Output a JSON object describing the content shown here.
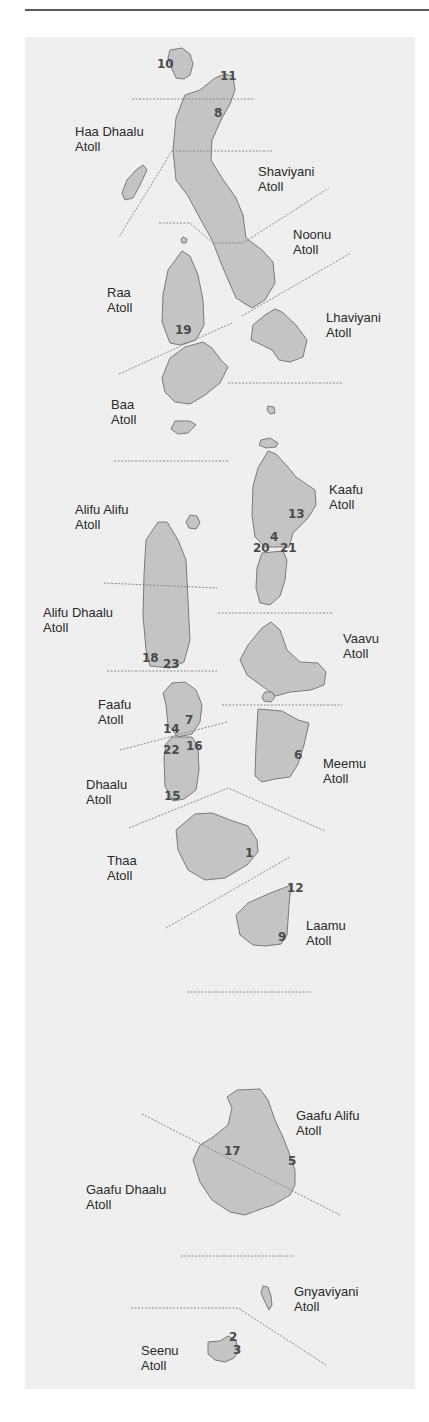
{
  "map": {
    "colors": {
      "panel": "#efefef",
      "island_fill": "#c4c4c4",
      "island_stroke": "#7a7a7a",
      "divider": "#8a8a8a",
      "label": "#2a2a2a",
      "number": "#4a4a4a"
    },
    "atolls": [
      {
        "name": "Haa Dhaalu",
        "suffix": "Atoll"
      },
      {
        "name": "Shaviyani",
        "suffix": "Atoll"
      },
      {
        "name": "Noonu",
        "suffix": "Atoll"
      },
      {
        "name": "Raa",
        "suffix": "Atoll"
      },
      {
        "name": "Lhaviyani",
        "suffix": "Atoll"
      },
      {
        "name": "Baa",
        "suffix": "Atoll"
      },
      {
        "name": "Kaafu",
        "suffix": "Atoll"
      },
      {
        "name": "Alifu Alifu",
        "suffix": "Atoll"
      },
      {
        "name": "Alifu Dhaalu",
        "suffix": "Atoll"
      },
      {
        "name": "Vaavu",
        "suffix": "Atoll"
      },
      {
        "name": "Faafu",
        "suffix": "Atoll"
      },
      {
        "name": "Meemu",
        "suffix": "Atoll"
      },
      {
        "name": "Dhaalu",
        "suffix": "Atoll"
      },
      {
        "name": "Thaa",
        "suffix": "Atoll"
      },
      {
        "name": "Laamu",
        "suffix": "Atoll"
      },
      {
        "name": "Gaafu Alifu",
        "suffix": "Atoll"
      },
      {
        "name": "Gaafu Dhaalu",
        "suffix": "Atoll"
      },
      {
        "name": "Gnyaviyani",
        "suffix": "Atoll"
      },
      {
        "name": "Seenu",
        "suffix": "Atoll"
      }
    ],
    "sites": [
      {
        "n": "10",
        "x": 157,
        "y": 68
      },
      {
        "n": "11",
        "x": 220,
        "y": 80
      },
      {
        "n": "8",
        "x": 214,
        "y": 117
      },
      {
        "n": "19",
        "x": 175,
        "y": 334
      },
      {
        "n": "13",
        "x": 288,
        "y": 518
      },
      {
        "n": "4",
        "x": 270,
        "y": 541
      },
      {
        "n": "20",
        "x": 253,
        "y": 552
      },
      {
        "n": "21",
        "x": 280,
        "y": 552
      },
      {
        "n": "18",
        "x": 142,
        "y": 662
      },
      {
        "n": "23",
        "x": 163,
        "y": 668
      },
      {
        "n": "7",
        "x": 185,
        "y": 724
      },
      {
        "n": "14",
        "x": 163,
        "y": 733
      },
      {
        "n": "22",
        "x": 163,
        "y": 754
      },
      {
        "n": "16",
        "x": 186,
        "y": 750
      },
      {
        "n": "6",
        "x": 294,
        "y": 759
      },
      {
        "n": "15",
        "x": 164,
        "y": 800
      },
      {
        "n": "1",
        "x": 245,
        "y": 857
      },
      {
        "n": "12",
        "x": 287,
        "y": 892
      },
      {
        "n": "9",
        "x": 278,
        "y": 941
      },
      {
        "n": "17",
        "x": 224,
        "y": 1155
      },
      {
        "n": "5",
        "x": 288,
        "y": 1165
      },
      {
        "n": "2",
        "x": 229,
        "y": 1341
      },
      {
        "n": "3",
        "x": 233,
        "y": 1354
      }
    ]
  }
}
